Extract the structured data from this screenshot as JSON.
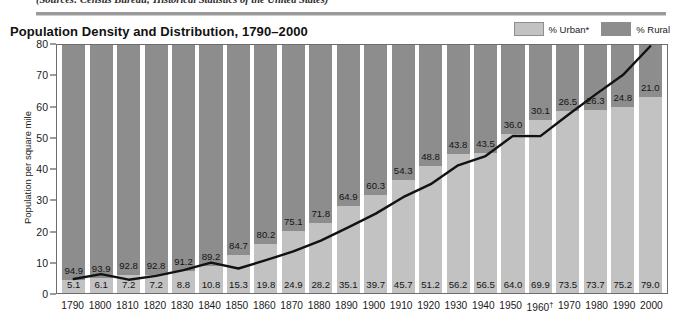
{
  "source_note": "(Sources: Census Bureau; Historical Statistics of the United States)",
  "header": {
    "title": "Population Density and Distribution, 1790–2000"
  },
  "legend": {
    "items": [
      {
        "label": "% Urban*",
        "color": "#c2c2c2",
        "name": "legend-urban"
      },
      {
        "label": "% Rural",
        "color": "#8d8d8d",
        "name": "legend-rural"
      }
    ]
  },
  "axes": {
    "y_title": "Population per square mile",
    "y_ticks": [
      "80",
      "70",
      "60",
      "50",
      "40",
      "30",
      "20",
      "10",
      "0"
    ]
  },
  "chart_data": {
    "type": "bar",
    "title": "Population Density and Distribution, 1790–2000",
    "xlabel": "",
    "ylabel": "Population per square mile",
    "ylim": [
      0,
      80
    ],
    "grid": false,
    "legend_position": "top-right",
    "categories": [
      "1790",
      "1800",
      "1810",
      "1820",
      "1830",
      "1840",
      "1850",
      "1860",
      "1870",
      "1880",
      "1890",
      "1900",
      "1910",
      "1920",
      "1930",
      "1940",
      "1950",
      "1960†",
      "1970",
      "1980",
      "1990",
      "2000"
    ],
    "series": [
      {
        "name": "% Urban*",
        "type": "bar-stack",
        "color": "#c2c2c2",
        "values": [
          5.1,
          6.1,
          7.2,
          7.2,
          8.8,
          10.8,
          15.3,
          19.8,
          24.9,
          28.2,
          35.1,
          39.7,
          45.7,
          51.2,
          56.2,
          56.5,
          64.0,
          69.9,
          73.5,
          73.7,
          75.2,
          79.0
        ]
      },
      {
        "name": "% Rural",
        "type": "bar-stack",
        "color": "#8d8d8d",
        "values": [
          94.9,
          93.9,
          92.8,
          92.8,
          91.2,
          89.2,
          84.7,
          80.2,
          75.1,
          71.8,
          64.9,
          60.3,
          54.3,
          48.8,
          43.8,
          43.5,
          36.0,
          30.1,
          26.5,
          26.3,
          24.8,
          21.0
        ]
      },
      {
        "name": "Population per square mile",
        "type": "line",
        "color": "#121212",
        "values": [
          4.5,
          6.1,
          4.3,
          5.5,
          7.4,
          9.8,
          7.9,
          10.6,
          13.4,
          16.9,
          21.2,
          25.6,
          30.9,
          35.1,
          41.2,
          44.2,
          50.7,
          50.6,
          57.4,
          64.0,
          70.3,
          79.6
        ]
      }
    ]
  },
  "footnote_markers": "* †"
}
